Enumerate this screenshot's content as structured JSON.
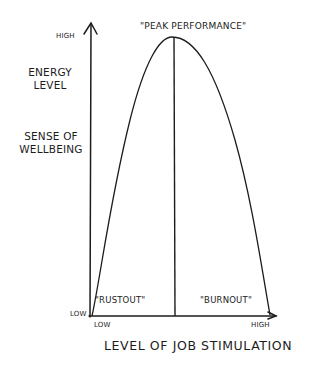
{
  "diagram": {
    "y_axis": {
      "high_label": "High",
      "low_label": "Low",
      "title_line1": "Energy",
      "title_line2": "Level",
      "subtitle_line1": "Sense of",
      "subtitle_line2": "Wellbeing"
    },
    "x_axis": {
      "low_label": "Low",
      "high_label": "High",
      "title": "Level of Job Stimulation"
    },
    "peak_label": "\"Peak Performance\"",
    "left_region_label": "\"Rustout\"",
    "right_region_label": "\"Burnout\"",
    "colors": {
      "ink": "#1c1c1c",
      "background": "#ffffff"
    }
  }
}
